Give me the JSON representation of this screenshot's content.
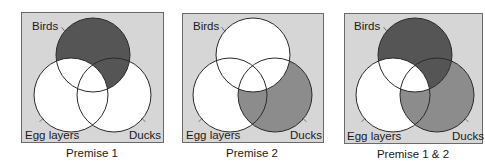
{
  "figure": {
    "width": 485,
    "height": 164,
    "colors": {
      "page_background": "#ffffff",
      "panel_background": "#d6d6d6",
      "panel_border": "#6a6a6a",
      "circle_fill": "#ffffff",
      "circle_stroke": "#2a2a2a",
      "dark_shade": "#555555",
      "medium_shade": "#8c8c8c",
      "text": "#1a1a1a"
    },
    "sets": [
      "Birds",
      "Egg layers",
      "Ducks"
    ],
    "panels": [
      {
        "id": "premise-1",
        "caption": "Premise 1",
        "box": {
          "x": 21,
          "y": 12,
          "w": 142,
          "h": 130
        },
        "circles": {
          "birds": {
            "cx": 93,
            "cy": 55,
            "r": 37
          },
          "egg": {
            "cx": 71,
            "cy": 95,
            "r": 37
          },
          "ducks": {
            "cx": 114,
            "cy": 95,
            "r": 37
          }
        },
        "labels": {
          "birds": {
            "text": "Birds",
            "x": 32,
            "y": 30
          },
          "egg": {
            "text": "Egg layers",
            "x": 25,
            "y": 139
          },
          "ducks": {
            "text": "Ducks",
            "x": 129,
            "y": 139
          }
        },
        "caption_pos": {
          "x": 92,
          "y": 157
        },
        "shading": [
          {
            "region": "Birds minus Egg layers",
            "shade": "dark"
          }
        ]
      },
      {
        "id": "premise-2",
        "caption": "Premise 2",
        "box": {
          "x": 182,
          "y": 13,
          "w": 141,
          "h": 129
        },
        "circles": {
          "birds": {
            "cx": 253,
            "cy": 55,
            "r": 37
          },
          "egg": {
            "cx": 230,
            "cy": 95,
            "r": 37
          },
          "ducks": {
            "cx": 275,
            "cy": 95,
            "r": 37
          }
        },
        "labels": {
          "birds": {
            "text": "Birds",
            "x": 193,
            "y": 30
          },
          "egg": {
            "text": "Egg layers",
            "x": 186,
            "y": 139
          },
          "ducks": {
            "text": "Ducks",
            "x": 290,
            "y": 139
          }
        },
        "caption_pos": {
          "x": 252,
          "y": 157
        },
        "shading": [
          {
            "region": "Ducks minus Birds",
            "shade": "medium"
          }
        ]
      },
      {
        "id": "premise-1-and-2",
        "caption": "Premise 1 & 2",
        "box": {
          "x": 344,
          "y": 13,
          "w": 138,
          "h": 130
        },
        "circles": {
          "birds": {
            "cx": 415,
            "cy": 55,
            "r": 37
          },
          "egg": {
            "cx": 393,
            "cy": 95,
            "r": 37
          },
          "ducks": {
            "cx": 437,
            "cy": 95,
            "r": 37
          }
        },
        "labels": {
          "birds": {
            "text": "Birds",
            "x": 354,
            "y": 30
          },
          "egg": {
            "text": "Egg layers",
            "x": 347,
            "y": 140
          },
          "ducks": {
            "text": "Ducks",
            "x": 452,
            "y": 140
          }
        },
        "caption_pos": {
          "x": 413,
          "y": 158
        },
        "shading": [
          {
            "region": "Birds minus Egg layers",
            "shade": "dark"
          },
          {
            "region": "Ducks minus Birds",
            "shade": "medium"
          }
        ]
      }
    ]
  }
}
